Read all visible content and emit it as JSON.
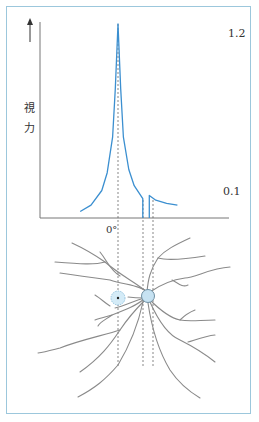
{
  "figure": {
    "y_label_chars": [
      "視",
      "力"
    ],
    "y_high_value": "1.2",
    "y_low_value": "0.1",
    "x_origin_label": "0°",
    "caption": ""
  },
  "chart_data": {
    "type": "line",
    "title": "",
    "ylabel": "視力",
    "xlabel": "",
    "x_tick_labels": [
      "0°"
    ],
    "annotations": [
      "1.2",
      "0.1"
    ],
    "series": [
      {
        "name": "visual-acuity",
        "color": "#3b8fd0",
        "x": [
          -7,
          -5,
          -3,
          -2,
          -1,
          -0.5,
          0,
          0.5,
          1,
          2,
          3,
          4.6,
          4.6
        ],
        "y": [
          0.04,
          0.08,
          0.17,
          0.28,
          0.5,
          0.8,
          1.2,
          0.8,
          0.5,
          0.3,
          0.2,
          0.12,
          0.0
        ]
      },
      {
        "name": "visual-acuity-after-blind-spot",
        "color": "#3b8fd0",
        "x": [
          5.8,
          5.8,
          7,
          9,
          11
        ],
        "y": [
          0.0,
          0.14,
          0.11,
          0.09,
          0.08
        ]
      }
    ],
    "blind_spot_range": [
      4.6,
      5.8
    ],
    "ylim": [
      0,
      1.25
    ]
  }
}
